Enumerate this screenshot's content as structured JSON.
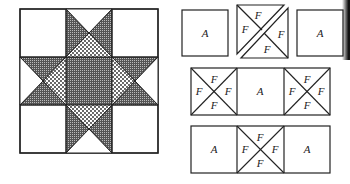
{
  "figure": {
    "quilt_block": {
      "name": "Ohio Star block",
      "grid": "3x3",
      "fills": {
        "background": "#ffffff",
        "star_points": "crosshatch",
        "center_square": "crosshatch",
        "inner_triangles": "dotted"
      }
    },
    "pieces": {
      "row1": [
        {
          "label": "A"
        },
        {
          "labels": [
            "F",
            "F",
            "F",
            "F"
          ],
          "type": "split-quarter-square"
        },
        {
          "label": "A"
        }
      ],
      "row2": [
        {
          "labels": [
            "F",
            "F",
            "F",
            "F"
          ],
          "type": "quarter-square"
        },
        {
          "label": "A"
        },
        {
          "labels": [
            "F",
            "F",
            "F",
            "F"
          ],
          "type": "quarter-square"
        }
      ],
      "row3": [
        {
          "label": "A"
        },
        {
          "labels": [
            "F",
            "F",
            "F",
            "F"
          ],
          "type": "quarter-square"
        },
        {
          "label": "A"
        }
      ]
    },
    "label_A": "A",
    "label_F": "F"
  }
}
